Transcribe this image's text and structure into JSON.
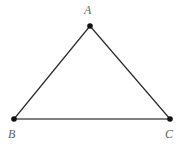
{
  "figure": {
    "kind": "geometry-diagram",
    "shape": "triangle",
    "background_color": "#ffffff",
    "width": 188,
    "height": 148
  },
  "style": {
    "edge_color": "#2b2b2b",
    "base_edge_color": "#545454",
    "edge_width": 1.2,
    "base_edge_width": 1.7,
    "vertex_color": "#111111",
    "vertex_radius": 2.8,
    "label_color": "#5f5f5f"
  },
  "vertices": [
    {
      "id": "A",
      "label": "A",
      "x": 90,
      "y": 26,
      "label_x": 84,
      "label_y": 4
    },
    {
      "id": "B",
      "label": "B",
      "x": 14,
      "y": 119,
      "label_x": 8,
      "label_y": 128
    },
    {
      "id": "C",
      "label": "C",
      "x": 170,
      "y": 119,
      "label_x": 165,
      "label_y": 128
    }
  ],
  "edges": [
    {
      "id": "AB",
      "from": "A",
      "to": "B",
      "x1": 90,
      "y1": 26,
      "x2": 14,
      "y2": 119
    },
    {
      "id": "AC",
      "from": "A",
      "to": "C",
      "x1": 90,
      "y1": 26,
      "x2": 170,
      "y2": 119
    },
    {
      "id": "BC",
      "from": "B",
      "to": "C",
      "x1": 14,
      "y1": 119,
      "x2": 170,
      "y2": 119
    }
  ]
}
